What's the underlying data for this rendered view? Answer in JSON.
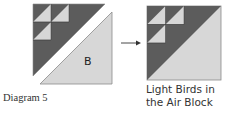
{
  "diagram_label": "Diagram 5",
  "left_unit": {
    "piece_label": "B"
  },
  "arrow": {
    "icon": "arrow-right-icon"
  },
  "result": {
    "caption_line1": "Light Birds in",
    "caption_line2": "the Air Block"
  },
  "colors": {
    "dark": "#5c5c5c",
    "light": "#d7d7d7",
    "outline": "#8a8a8a",
    "seam": "#3a3a3a"
  }
}
